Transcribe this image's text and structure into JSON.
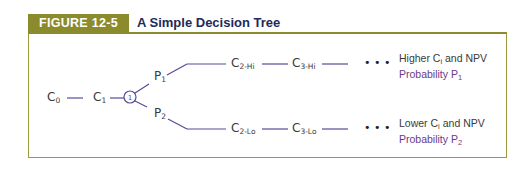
{
  "figure": {
    "label": "FIGURE 12-5",
    "title": "A Simple Decision Tree",
    "accent_color": "#8b8a2c",
    "line_color": "#5a4a9a"
  },
  "tree": {
    "root": {
      "main": "C",
      "sub": "0"
    },
    "first": {
      "main": "C",
      "sub": "1"
    },
    "decision_node": "1",
    "branches": [
      {
        "prob": {
          "main": "P",
          "sub": "1"
        },
        "c2": {
          "main": "C",
          "sub": "2-Hi"
        },
        "c3": {
          "main": "C",
          "sub": "3-Hi"
        },
        "ellipsis": "• • •",
        "outcome_line1_pre": "Higher C",
        "outcome_line1_sub": "i",
        "outcome_line1_post": " and NPV",
        "outcome_line2_pre": "Probability P",
        "outcome_line2_sub": "1"
      },
      {
        "prob": {
          "main": "P",
          "sub": "2"
        },
        "c2": {
          "main": "C",
          "sub": "2-Lo"
        },
        "c3": {
          "main": "C",
          "sub": "3-Lo"
        },
        "ellipsis": "• • •",
        "outcome_line1_pre": "Lower C",
        "outcome_line1_sub": "i",
        "outcome_line1_post": " and NPV",
        "outcome_line2_pre": "Probability P",
        "outcome_line2_sub": "2"
      }
    ]
  }
}
